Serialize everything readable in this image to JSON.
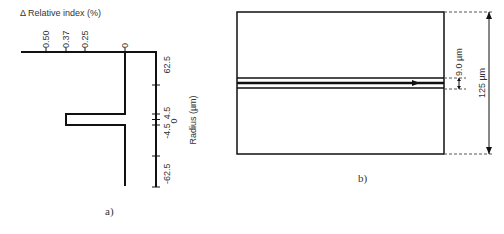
{
  "panel_a": {
    "caption": "a)",
    "x_axis_title": "Δ Relative index (%)",
    "x_ticks": [
      "0.50",
      "0.37",
      "0.25",
      "0"
    ],
    "y_axis_title": "Radius (µm)",
    "y_ticks": [
      "62.5",
      "4.5",
      "0",
      "-4.5",
      "-62.5"
    ],
    "profile": {
      "cladding_delta": 0,
      "core_delta": 0.37,
      "core_radius_um": 4.5,
      "cladding_radius_um": 62.5
    }
  },
  "panel_b": {
    "caption": "b)",
    "core_diameter_label": "9.0 µm",
    "cladding_diameter_label": "125 µm"
  },
  "colors": {
    "line": "#111111",
    "background": "#ffffff"
  }
}
